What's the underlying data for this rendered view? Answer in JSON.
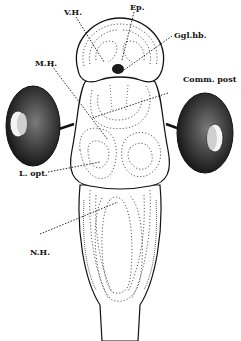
{
  "figure": {
    "type": "anatomical illustration",
    "ink_color": "#111111",
    "background": "#ffffff"
  },
  "labels": {
    "vh": "V.H.",
    "ep": "Ep.",
    "gglhb": "Ggl.hb.",
    "mh": "M.H.",
    "comm_post": "Comm. post",
    "lopt": "L. opt.",
    "nh": "N.H."
  },
  "structures": [
    {
      "id": "forebrain",
      "label_ref": "vh"
    },
    {
      "id": "epiphysis",
      "label_ref": "ep"
    },
    {
      "id": "ganglion-habenulae",
      "label_ref": "gglhb"
    },
    {
      "id": "midbrain",
      "label_ref": "mh"
    },
    {
      "id": "posterior-commissure",
      "label_ref": "comm_post"
    },
    {
      "id": "optic-lobe",
      "label_ref": "lopt"
    },
    {
      "id": "hindbrain",
      "label_ref": "nh"
    },
    {
      "id": "left-eye"
    },
    {
      "id": "right-eye"
    }
  ]
}
